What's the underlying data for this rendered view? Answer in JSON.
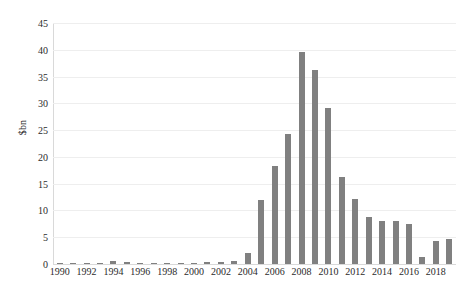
{
  "chart_data": {
    "type": "bar",
    "title": "",
    "subtitle": "",
    "xlabel": "",
    "ylabel": "$bn",
    "ylim": [
      0,
      45
    ],
    "ytick_values": [
      0,
      5,
      10,
      15,
      20,
      25,
      30,
      35,
      40,
      45
    ],
    "ytick_labels": [
      "0",
      "5",
      "10",
      "15",
      "20",
      "25",
      "30",
      "35",
      "40",
      "45"
    ],
    "xtick_labels": [
      "1990",
      "1992",
      "1994",
      "1996",
      "1998",
      "2000",
      "2002",
      "2004",
      "2006",
      "2008",
      "2010",
      "2012",
      "2014",
      "2016",
      "2018"
    ],
    "grid": "horizontal",
    "legend": "none",
    "bar_color": "#808080",
    "gridline_color": "#eeeeee",
    "axis_color": "#d9d9d9",
    "categories": [
      "1990",
      "1991",
      "1992",
      "1993",
      "1994",
      "1995",
      "1996",
      "1997",
      "1998",
      "1999",
      "2000",
      "2001",
      "2002",
      "2003",
      "2004",
      "2005",
      "2006",
      "2007",
      "2008",
      "2009",
      "2010",
      "2011",
      "2012",
      "2013",
      "2014",
      "2015",
      "2016",
      "2017",
      "2018",
      "2019"
    ],
    "values": [
      0.1,
      0.1,
      0.15,
      0.1,
      0.5,
      0.3,
      0.1,
      0.1,
      0.05,
      0.05,
      0.15,
      0.35,
      0.3,
      0.5,
      2.0,
      12.0,
      18.3,
      24.3,
      39.5,
      36.3,
      29.2,
      16.3,
      12.1,
      8.8,
      8.0,
      8.1,
      7.4,
      1.4,
      4.3,
      4.6
    ]
  }
}
